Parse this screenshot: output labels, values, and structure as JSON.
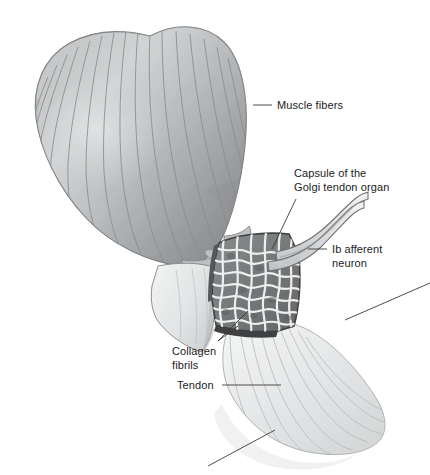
{
  "figure": {
    "title": "Golgi tendon organ",
    "width": 430,
    "height": 475,
    "background_color": "#ffffff",
    "style": "grayscale anatomical illustration"
  },
  "labels": [
    {
      "id": "muscle-fibers",
      "text": "Muscle fibers",
      "lines": [
        "Muscle fibers"
      ],
      "x": 277,
      "y": 99,
      "leader": {
        "x1": 253,
        "y1": 105,
        "x2": 272,
        "y2": 105
      }
    },
    {
      "id": "capsule-golgi-tendon-organ",
      "text": "Capsule of the Golgi tendon organ",
      "lines": [
        "Capsule of the",
        "Golgi tendon organ"
      ],
      "x": 294,
      "y": 167,
      "leader": {
        "x1": 272,
        "y1": 249,
        "x2": 296,
        "y2": 199
      }
    },
    {
      "id": "ib-afferent-neuron",
      "text": "Ib afferent neuron",
      "lines": [
        "Ib afferent",
        "neuron"
      ],
      "x": 332,
      "y": 243,
      "leader": {
        "x1": 308,
        "y1": 249,
        "x2": 327,
        "y2": 249
      }
    },
    {
      "id": "collagen-fibrils",
      "text": "Collagen fibrils",
      "lines": [
        "Collagen",
        "fibrils"
      ],
      "x": 172,
      "y": 345,
      "leader": {
        "x1": 218,
        "y1": 341,
        "x2": 248,
        "y2": 311
      }
    },
    {
      "id": "tendon",
      "text": "Tendon",
      "lines": [
        "Tendon"
      ],
      "x": 177,
      "y": 379,
      "leader": {
        "x1": 222,
        "y1": 385,
        "x2": 281,
        "y2": 385
      }
    }
  ],
  "colors": {
    "text": "#1b1b1b",
    "leader_line": "#3a3a3a",
    "muscle_dark": "#8e9092",
    "muscle_mid": "#b0b2b4",
    "muscle_light": "#cdcfd0",
    "muscle_stripe": "#8a8d8f",
    "capsule_fill": "#7f8183",
    "capsule_border": "#3f4042",
    "fibril": "#eceded",
    "tendon_pale": "#e9eaea",
    "tendon_line": "#b9bbbc",
    "nerve_outline": "#6e7072",
    "nerve_fill": "#e4e5e6"
  },
  "structures": [
    {
      "id": "muscle-belly",
      "name": "Muscle belly with longitudinal muscle fibers"
    },
    {
      "id": "golgi-capsule",
      "name": "Capsule of the Golgi tendon organ, cut open"
    },
    {
      "id": "collagen-braid",
      "name": "Interwoven collagen fibrils and nerve endings inside capsule"
    },
    {
      "id": "ib-neuron",
      "name": "Ib afferent neuron trunk exiting capsule"
    },
    {
      "id": "tendon-fan",
      "name": "Tendon fanning downward and to the right"
    },
    {
      "id": "cut-tendon-flap",
      "name": "Cut edge flap of tendon sheet"
    }
  ]
}
